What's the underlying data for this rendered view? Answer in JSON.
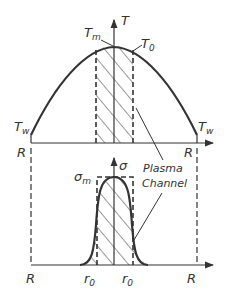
{
  "diagram": {
    "colors": {
      "ink": "#333333",
      "background": "#ffffff"
    },
    "top_plot": {
      "y_axis_label": "T",
      "peak_label": "T",
      "peak_label_sub": "m",
      "channel_edge_label": "T",
      "channel_edge_label_sub": "0",
      "wall_label_left": "T",
      "wall_label_left_sub": "w",
      "wall_label_right": "T",
      "wall_label_right_sub": "w",
      "x_label_left": "R",
      "x_label_right": "R"
    },
    "bottom_plot": {
      "y_axis_label": "σ",
      "peak_label": "σ",
      "peak_label_sub": "m",
      "x_label_left": "R",
      "x_label_right": "R",
      "radius_label_left": "r",
      "radius_label_left_sub": "0",
      "radius_label_right": "r",
      "radius_label_right_sub": "0"
    },
    "annotation": {
      "line1": "Plasma",
      "line2": "Channel"
    }
  }
}
